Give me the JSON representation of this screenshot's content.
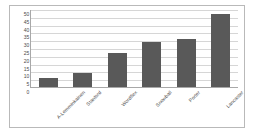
{
  "chart_data": {
    "type": "bar",
    "title": "",
    "subtitle": "",
    "xlabel": "",
    "ylabel": "",
    "categories": [
      "A-Lemminkainen",
      "Stanford",
      "Wordflex",
      "Snowball",
      "Porter",
      "Lancaster"
    ],
    "values": [
      6,
      9,
      22,
      29,
      31,
      47
    ],
    "ylim": [
      0,
      50
    ],
    "ytick_step": 5,
    "yticks": [
      "0",
      "5",
      "10",
      "15",
      "20",
      "25",
      "30",
      "35",
      "40",
      "45",
      "50"
    ],
    "grid": true,
    "grid_axis": "y",
    "legend": false,
    "legend_position": "none",
    "bar_color": "#595959",
    "grid_color": "#d6d6d6",
    "axis_color": "#a8a8a8",
    "frame_color": "#b9b9b9",
    "background": "#ffffff",
    "tick_label_rotation": -45
  }
}
